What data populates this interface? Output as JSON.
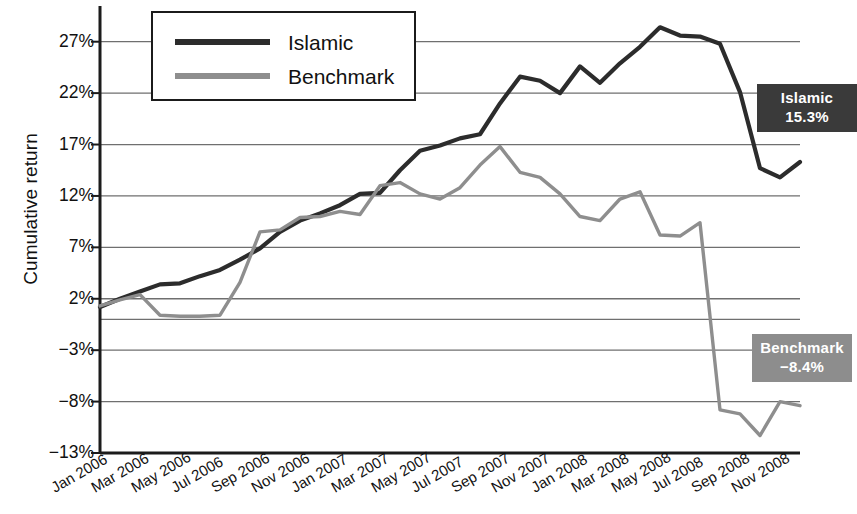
{
  "chart_data": {
    "type": "line",
    "title": "",
    "xlabel": "",
    "ylabel": "Cumulative return",
    "ylim": [
      -13,
      29.5
    ],
    "yticks": [
      27,
      22,
      17,
      12,
      7,
      2,
      -3,
      -8,
      -13
    ],
    "ytick_labels": [
      "27%",
      "22%",
      "17%",
      "12%",
      "7%",
      "2%",
      "−3%",
      "−8%",
      "−13%"
    ],
    "grid": true,
    "legend_position": "top-left",
    "x": [
      "Jan 2006",
      "Feb 2006",
      "Mar 2006",
      "Apr 2006",
      "May 2006",
      "Jun 2006",
      "Jul 2006",
      "Aug 2006",
      "Sep 2006",
      "Oct 2006",
      "Nov 2006",
      "Dec 2006",
      "Jan 2007",
      "Feb 2007",
      "Mar 2007",
      "Apr 2007",
      "May 2007",
      "Jun 2007",
      "Jul 2007",
      "Aug 2007",
      "Sep 2007",
      "Oct 2007",
      "Nov 2007",
      "Dec 2007",
      "Jan 2008",
      "Feb 2008",
      "Mar 2008",
      "Apr 2008",
      "May 2008",
      "Jun 2008",
      "Jul 2008",
      "Aug 2008",
      "Sep 2008",
      "Oct 2008",
      "Nov 2008",
      "Dec 2008"
    ],
    "xtick_labels": [
      "Jan 2006",
      "Mar 2006",
      "May 2006",
      "Jul 2006",
      "Sep 2006",
      "Nov 2006",
      "Jan 2007",
      "Mar 2007",
      "May 2007",
      "Jul 2007",
      "Sep 2007",
      "Nov 2007",
      "Jan 2008",
      "Mar 2008",
      "May 2008",
      "Jul 2008",
      "Sep 2008",
      "Nov 2008"
    ],
    "xtick_indices": [
      0,
      2,
      4,
      6,
      8,
      10,
      12,
      14,
      16,
      18,
      20,
      22,
      24,
      26,
      28,
      30,
      32,
      34
    ],
    "series": [
      {
        "name": "Islamic",
        "color": "#2c2c2c",
        "end_value": 15.3,
        "end_label": "15.3%",
        "values": [
          1.2,
          2.0,
          2.7,
          3.4,
          3.5,
          4.2,
          4.8,
          5.8,
          6.9,
          8.5,
          9.6,
          10.3,
          11.1,
          12.2,
          12.3,
          14.5,
          16.4,
          16.9,
          17.6,
          18.0,
          21.0,
          23.6,
          23.2,
          22.0,
          24.6,
          23.0,
          24.9,
          26.5,
          28.4,
          27.6,
          27.5,
          26.8,
          22.1,
          14.7,
          13.8,
          15.3
        ]
      },
      {
        "name": "Benchmark",
        "color": "#8e8e8e",
        "end_value": -8.4,
        "end_label": "−8.4%",
        "values": [
          1.3,
          1.9,
          2.4,
          0.4,
          0.3,
          0.3,
          0.4,
          3.6,
          8.5,
          8.7,
          9.9,
          10.0,
          10.5,
          10.2,
          13.0,
          13.3,
          12.2,
          11.7,
          12.8,
          15.0,
          16.8,
          14.3,
          13.8,
          12.2,
          10.0,
          9.6,
          11.7,
          12.4,
          8.2,
          8.1,
          9.4,
          -8.8,
          -9.2,
          -11.3,
          -8.0,
          -8.4
        ]
      }
    ]
  },
  "legend": {
    "items": [
      {
        "label": "Islamic"
      },
      {
        "label": "Benchmark"
      }
    ]
  },
  "end_labels": {
    "islamic": {
      "name": "Islamic",
      "value": "15.3%"
    },
    "benchmark": {
      "name": "Benchmark",
      "value": "−8.4%"
    }
  }
}
